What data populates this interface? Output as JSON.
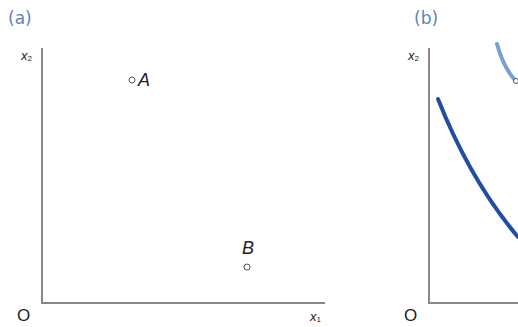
{
  "panels": [
    {
      "label": "(a)",
      "y_axis": {
        "name": "x",
        "sub": "2"
      },
      "x_axis": {
        "name": "x",
        "sub": "1"
      },
      "origin": "O",
      "points": [
        {
          "label": "A"
        },
        {
          "label": "B"
        }
      ]
    },
    {
      "label": "(b)",
      "y_axis": {
        "name": "x",
        "sub": "2"
      },
      "origin": "O",
      "curves": [
        {
          "name": "indifference-curve-lower",
          "color": "#1f4fa0"
        },
        {
          "name": "indifference-curve-upper",
          "color": "#7a9fd0"
        }
      ]
    }
  ],
  "colors": {
    "axis": "#888888",
    "label_accent": "#5b84b8",
    "curve_dark": "#1f4fa0",
    "curve_light": "#7a9fd0"
  }
}
